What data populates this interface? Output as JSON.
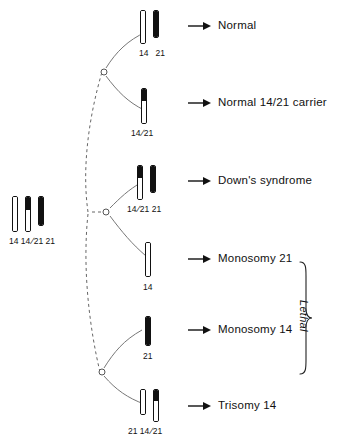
{
  "figure": {
    "parent": {
      "label_text": "14 14/21 21",
      "chromosomes": [
        {
          "name": "chromosome-14",
          "label": "14",
          "top": "white",
          "bottom": "white"
        },
        {
          "name": "chromosome-14-21-translocation",
          "label": "14/21",
          "top": "black",
          "bottom": "white"
        },
        {
          "name": "chromosome-21",
          "label": "21",
          "top": "black",
          "bottom": "black"
        }
      ]
    },
    "arrow_glyph": "→",
    "lethal_label": "Lethal",
    "outcomes": [
      {
        "id": "normal",
        "text": "Normal",
        "gametes_label": "14    21",
        "chromosomes": [
          {
            "name": "chromosome-14",
            "label": "14",
            "top": "white",
            "bottom": "white"
          },
          {
            "name": "chromosome-21",
            "label": "21",
            "top": "black",
            "bottom": "black"
          }
        ]
      },
      {
        "id": "normal-carrier",
        "text": "Normal 14/21 carrier",
        "gametes_label": "14/21",
        "chromosomes": [
          {
            "name": "chromosome-14-21-translocation",
            "label": "14/21",
            "top": "black",
            "bottom": "white"
          }
        ]
      },
      {
        "id": "downs-syndrome",
        "text": "Down's syndrome",
        "gametes_label": "14/21  21",
        "chromosomes": [
          {
            "name": "chromosome-14-21-translocation",
            "label": "14/21",
            "top": "black",
            "bottom": "white"
          },
          {
            "name": "chromosome-21",
            "label": "21",
            "top": "black",
            "bottom": "black"
          }
        ]
      },
      {
        "id": "monosomy-21",
        "text": "Monosomy 21",
        "gametes_label": "14",
        "chromosomes": [
          {
            "name": "chromosome-14",
            "label": "14",
            "top": "white",
            "bottom": "white"
          }
        ]
      },
      {
        "id": "monosomy-14",
        "text": "Monosomy 14",
        "gametes_label": "21",
        "chromosomes": [
          {
            "name": "chromosome-21",
            "label": "21",
            "top": "black",
            "bottom": "black"
          }
        ]
      },
      {
        "id": "trisomy-14",
        "text": "Trisomy 14",
        "gametes_label": "21  14/21",
        "chromosomes": [
          {
            "name": "chromosome-21-short",
            "label": "21",
            "top": "white",
            "bottom": "white"
          },
          {
            "name": "chromosome-14-21-translocation",
            "label": "14/21",
            "top": "black",
            "bottom": "white"
          }
        ]
      }
    ],
    "colors": {
      "ink": "#111111",
      "background": "#ffffff",
      "line": "#555555"
    }
  }
}
